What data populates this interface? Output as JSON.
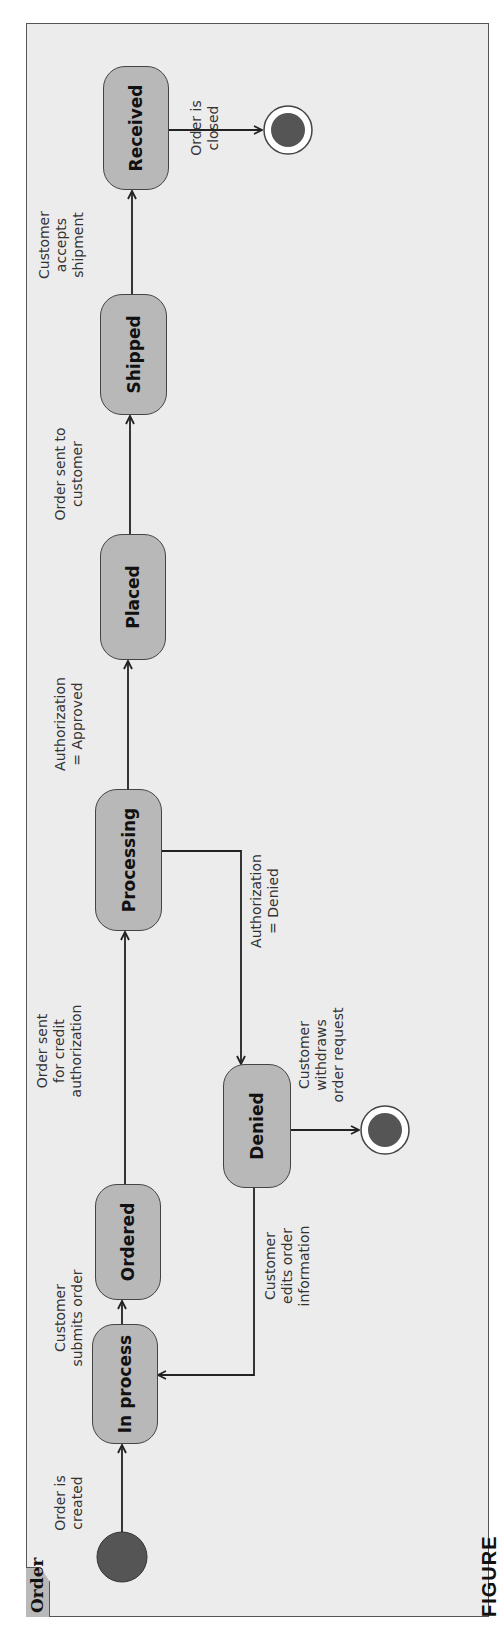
{
  "frame": {
    "title": "Order"
  },
  "caption": "FIGURE",
  "states": {
    "in_process": "In process",
    "ordered": "Ordered",
    "processing": "Processing",
    "denied": "Denied",
    "placed": "Placed",
    "shipped": "Shipped",
    "received": "Received"
  },
  "transitions": {
    "order_created": "Order is\ncreated",
    "submits_order": "Customer\nsubmits order",
    "credit_auth": "Order sent\nfor credit\nauthorization",
    "auth_approved": "Authorization\n= Approved",
    "auth_denied": "Authorization\n= Denied",
    "sent_to_customer": "Order sent to\ncustomer",
    "accepts_shipment": "Customer\naccepts\nshipment",
    "order_closed": "Order is\nclosed",
    "withdraws": "Customer\nwithdraws\norder request",
    "edits_info": "Customer\nedits order\ninformation"
  },
  "colors": {
    "frame_bg": "#ececec",
    "state_fill": "#b8b8b8",
    "node_fill": "#555555",
    "line": "#222222"
  }
}
